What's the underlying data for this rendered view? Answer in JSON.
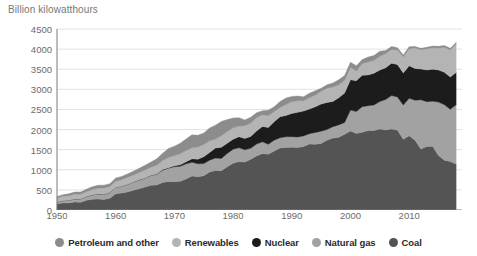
{
  "chart": {
    "axis_title": "Billion kilowatthours"
  },
  "legend": {
    "items": [
      {
        "label": "Petroleum and other",
        "color": "#8c8c8c",
        "key": "petroleum"
      },
      {
        "label": "Renewables",
        "color": "#b4b4b4",
        "key": "renewables"
      },
      {
        "label": "Nuclear",
        "color": "#1c1c1c",
        "key": "nuclear"
      },
      {
        "label": "Natural gas",
        "color": "#a2a2a2",
        "key": "natural_gas"
      },
      {
        "label": "Coal",
        "color": "#545454",
        "key": "coal"
      }
    ]
  },
  "chart_data": {
    "type": "area",
    "stacked": true,
    "title": "Billion kilowatthours",
    "xlabel": "",
    "ylabel": "Billion kilowatthours",
    "xlim": [
      1950,
      2019
    ],
    "ylim": [
      0,
      4500
    ],
    "ytick_labels": [
      "0",
      "500",
      "1000",
      "1500",
      "2000",
      "2500",
      "3000",
      "3500",
      "4000",
      "4500"
    ],
    "yticks": [
      0,
      500,
      1000,
      1500,
      2000,
      2500,
      3000,
      3500,
      4000,
      4500
    ],
    "xtick_labels": [
      "1950",
      "1960",
      "1970",
      "1980",
      "1990",
      "2000",
      "2010"
    ],
    "xticks": [
      1950,
      1960,
      1970,
      1980,
      1990,
      2000,
      2010
    ],
    "grid": true,
    "legend_position": "bottom",
    "stack_order_bottom_to_top": [
      "coal",
      "natural_gas",
      "nuclear",
      "renewables",
      "petroleum"
    ],
    "x": [
      1950,
      1951,
      1952,
      1953,
      1954,
      1955,
      1956,
      1957,
      1958,
      1959,
      1960,
      1961,
      1962,
      1963,
      1964,
      1965,
      1966,
      1967,
      1968,
      1969,
      1970,
      1971,
      1972,
      1973,
      1974,
      1975,
      1976,
      1977,
      1978,
      1979,
      1980,
      1981,
      1982,
      1983,
      1984,
      1985,
      1986,
      1987,
      1988,
      1989,
      1990,
      1991,
      1992,
      1993,
      1994,
      1995,
      1996,
      1997,
      1998,
      1999,
      2000,
      2001,
      2002,
      2003,
      2004,
      2005,
      2006,
      2007,
      2008,
      2009,
      2010,
      2011,
      2012,
      2013,
      2014,
      2015,
      2016,
      2017,
      2018
    ],
    "series": [
      {
        "name": "Coal",
        "color": "#545454",
        "values": [
          155,
          175,
          177,
          200,
          190,
          240,
          268,
          275,
          264,
          294,
          403,
          422,
          450,
          494,
          526,
          571,
          613,
          624,
          685,
          706,
          704,
          713,
          771,
          848,
          828,
          853,
          944,
          985,
          976,
          1075,
          1162,
          1203,
          1192,
          1259,
          1342,
          1402,
          1386,
          1464,
          1541,
          1554,
          1560,
          1551,
          1576,
          1639,
          1636,
          1653,
          1737,
          1788,
          1807,
          1881,
          1966,
          1904,
          1933,
          1974,
          1978,
          2013,
          1991,
          2016,
          1986,
          1756,
          1847,
          1733,
          1514,
          1581,
          1582,
          1352,
          1239,
          1206,
          1146
        ]
      },
      {
        "name": "Natural gas",
        "color": "#a2a2a2",
        "values": [
          45,
          55,
          65,
          75,
          85,
          95,
          110,
          120,
          125,
          145,
          158,
          169,
          183,
          202,
          220,
          222,
          248,
          262,
          306,
          333,
          373,
          374,
          376,
          341,
          320,
          300,
          295,
          306,
          305,
          329,
          346,
          346,
          305,
          274,
          297,
          292,
          249,
          273,
          253,
          267,
          264,
          264,
          264,
          259,
          291,
          307,
          262,
          283,
          309,
          297,
          518,
          543,
          636,
          620,
          635,
          684,
          759,
          829,
          823,
          853,
          931,
          996,
          1225,
          1113,
          1122,
          1333,
          1378,
          1296,
          1468
        ]
      },
      {
        "name": "Nuclear",
        "color": "#1c1c1c",
        "values": [
          0,
          0,
          0,
          0,
          0,
          0,
          0,
          0,
          0,
          0,
          1,
          2,
          2,
          3,
          3,
          4,
          6,
          8,
          13,
          14,
          22,
          38,
          54,
          83,
          114,
          173,
          191,
          251,
          276,
          255,
          251,
          273,
          283,
          294,
          328,
          384,
          414,
          455,
          527,
          529,
          577,
          613,
          619,
          610,
          640,
          673,
          675,
          629,
          674,
          728,
          754,
          769,
          780,
          764,
          789,
          782,
          787,
          806,
          806,
          799,
          807,
          790,
          769,
          789,
          797,
          797,
          806,
          805,
          807
        ]
      },
      {
        "name": "Renewables",
        "color": "#b4b4b4",
        "values": [
          101,
          110,
          114,
          117,
          115,
          117,
          130,
          150,
          158,
          143,
          152,
          160,
          175,
          170,
          182,
          200,
          196,
          225,
          228,
          254,
          254,
          272,
          280,
          275,
          306,
          304,
          291,
          224,
          288,
          287,
          283,
          267,
          313,
          335,
          330,
          291,
          297,
          257,
          226,
          275,
          295,
          288,
          255,
          284,
          291,
          317,
          356,
          357,
          323,
          318,
          310,
          240,
          293,
          321,
          318,
          344,
          353,
          342,
          365,
          398,
          427,
          507,
          477,
          528,
          535,
          545,
          622,
          674,
          708
        ]
      },
      {
        "name": "Petroleum and other",
        "color": "#8c8c8c",
        "values": [
          33,
          40,
          47,
          57,
          60,
          66,
          71,
          70,
          71,
          73,
          80,
          82,
          87,
          92,
          105,
          115,
          130,
          153,
          181,
          221,
          234,
          264,
          287,
          323,
          290,
          285,
          316,
          344,
          358,
          302,
          246,
          206,
          147,
          144,
          120,
          100,
          136,
          118,
          149,
          158,
          126,
          118,
          101,
          111,
          105,
          78,
          82,
          101,
          128,
          119,
          125,
          133,
          98,
          123,
          122,
          126,
          75,
          74,
          55,
          48,
          48,
          40,
          34,
          35,
          39,
          43,
          42,
          40,
          36
        ]
      }
    ]
  }
}
